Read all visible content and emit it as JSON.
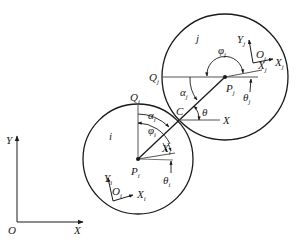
{
  "diagram": {
    "type": "geometric-contact-diagram",
    "colors": {
      "line": "#1a1a1a",
      "background": "#ffffff"
    },
    "global_frame": {
      "origin": "O",
      "x_axis": "X",
      "y_axis": "Y"
    },
    "circle_i": {
      "region_label": "i",
      "center_label": "P",
      "center_sub": "i",
      "top_point_label": "Q",
      "top_point_sub": "i",
      "frame_origin_label": "O",
      "frame_origin_sub": "i",
      "frame_x_label": "X",
      "frame_x_sub": "i",
      "frame_y_label": "Y",
      "frame_y_sub": "i",
      "body_x_label": "X",
      "body_x_sub": "i",
      "angle_alpha": "α",
      "angle_alpha_sub": "i",
      "angle_phi": "φ",
      "angle_phi_sub": "i",
      "angle_theta": "θ",
      "angle_theta_sub": "i"
    },
    "circle_j": {
      "region_label": "j",
      "center_label": "P",
      "center_sub": "j",
      "left_point_label": "Q",
      "left_point_sub": "j",
      "frame_origin_label": "O",
      "frame_origin_sub": "j",
      "frame_x_label": "X",
      "frame_x_sub": "j",
      "frame_y_label": "Y",
      "frame_y_sub": "j",
      "body_x_label": "X",
      "body_x_sub": "j",
      "angle_alpha": "α",
      "angle_alpha_sub": "j",
      "angle_phi": "φ",
      "angle_phi_sub": "j",
      "angle_theta": "θ",
      "angle_theta_sub": "j"
    },
    "contact": {
      "point_label": "C",
      "angle_label": "θ",
      "axis_label": "X"
    }
  }
}
